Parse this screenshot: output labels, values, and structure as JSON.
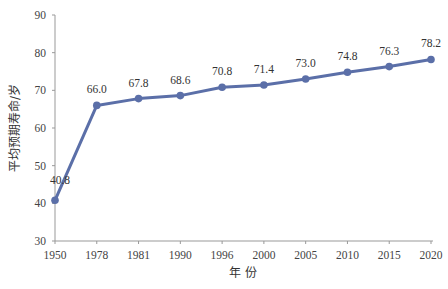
{
  "chart_data": {
    "type": "line",
    "title": "",
    "xlabel": "年 份",
    "ylabel": "平均预期寿命/岁",
    "categories": [
      "1950",
      "1978",
      "1981",
      "1990",
      "1996",
      "2000",
      "2005",
      "2010",
      "2015",
      "2020"
    ],
    "series": [
      {
        "name": "平均预期寿命",
        "values": [
          40.8,
          66.0,
          67.8,
          68.6,
          70.8,
          71.4,
          73.0,
          74.8,
          76.3,
          78.2
        ],
        "labels": [
          "40.8",
          "66.0",
          "67.8",
          "68.6",
          "70.8",
          "71.4",
          "73.0",
          "74.8",
          "76.3",
          "78.2"
        ],
        "color": "#5b6fa8"
      }
    ],
    "ylim": [
      30,
      90
    ],
    "yticks": [
      "30",
      "40",
      "50",
      "60",
      "70",
      "80",
      "90"
    ],
    "grid": false,
    "legend": "none"
  }
}
